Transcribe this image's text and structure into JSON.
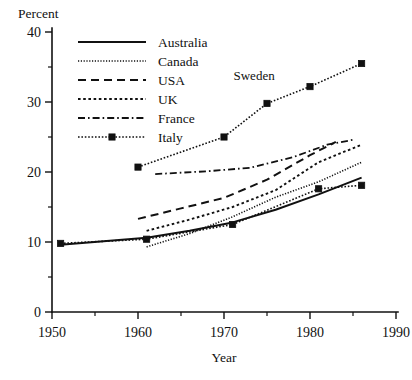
{
  "chart_data": {
    "type": "line",
    "title": "",
    "unit_label": "Percent",
    "xlabel": "Year",
    "ylabel": "Percent",
    "xlim": [
      1950,
      1990
    ],
    "ylim": [
      0,
      40
    ],
    "xticks": [
      1950,
      1960,
      1970,
      1980,
      1990
    ],
    "xticks_minor": [
      1955,
      1965,
      1975,
      1985
    ],
    "yticks": [
      0,
      10,
      20,
      30,
      40
    ],
    "yticks_minor": [
      5,
      15,
      25,
      35
    ],
    "grid": false,
    "legend_position": "top-left",
    "annotations": [
      {
        "text": "Sweden",
        "x": 1973.5,
        "y": 33.2
      }
    ],
    "series": [
      {
        "name": "Australia",
        "style": "solid",
        "marker": "none",
        "x": [
          1951,
          1961,
          1966,
          1971,
          1976,
          1981,
          1986
        ],
        "y": [
          9.6,
          10.6,
          11.6,
          12.8,
          14.6,
          16.8,
          19.2
        ]
      },
      {
        "name": "Canada",
        "style": "dotted-fine",
        "marker": "none",
        "x": [
          1961,
          1966,
          1971,
          1976,
          1981,
          1986
        ],
        "y": [
          9.3,
          11.2,
          13.6,
          16.4,
          18.6,
          21.4
        ]
      },
      {
        "name": "USA",
        "style": "dashed",
        "marker": "none",
        "x": [
          1960,
          1965,
          1970,
          1975,
          1980,
          1983
        ],
        "y": [
          13.3,
          14.8,
          16.3,
          18.9,
          22.4,
          24.3
        ]
      },
      {
        "name": "UK",
        "style": "dotted",
        "marker": "none",
        "x": [
          1961,
          1966,
          1971,
          1976,
          1981,
          1986
        ],
        "y": [
          11.6,
          13.2,
          15.0,
          17.4,
          21.4,
          23.9
        ]
      },
      {
        "name": "France",
        "style": "dash-dot",
        "marker": "none",
        "x": [
          1962,
          1968,
          1973,
          1978,
          1982,
          1985
        ],
        "y": [
          19.7,
          20.1,
          20.6,
          22.1,
          23.9,
          24.6
        ]
      },
      {
        "name": "Italy",
        "style": "dotted-marker",
        "marker": "square",
        "x": [
          1951,
          1961,
          1971,
          1981,
          1986
        ],
        "y": [
          9.8,
          10.4,
          12.5,
          17.6,
          18.1
        ]
      },
      {
        "name": "Sweden",
        "style": "dotted-marker",
        "marker": "square",
        "x": [
          1960,
          1970,
          1975,
          1980,
          1986
        ],
        "y": [
          20.7,
          25.0,
          29.8,
          32.2,
          35.5
        ]
      }
    ],
    "legend": [
      {
        "label": "Australia",
        "style": "solid",
        "marker": "none"
      },
      {
        "label": "Canada",
        "style": "dotted-fine",
        "marker": "none"
      },
      {
        "label": "USA",
        "style": "dashed",
        "marker": "none"
      },
      {
        "label": "UK",
        "style": "dotted",
        "marker": "none"
      },
      {
        "label": "France",
        "style": "dash-dot",
        "marker": "none"
      },
      {
        "label": "Italy",
        "style": "dotted-marker",
        "marker": "square"
      }
    ],
    "colors": {
      "ink": "#111111",
      "background": "#ffffff"
    }
  }
}
